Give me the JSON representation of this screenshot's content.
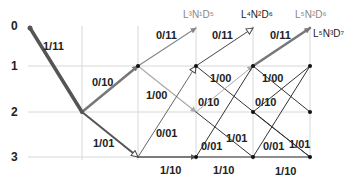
{
  "diagram": {
    "type": "trellis",
    "row_labels": [
      "0",
      "1",
      "2",
      "3"
    ],
    "grid": {
      "rows_y": [
        66,
        112,
        157
      ],
      "cols_x": [
        82,
        138,
        196,
        253,
        310
      ],
      "color": "#d8d8d8"
    },
    "state_labels": [
      {
        "text": "L³N¹D⁵",
        "x": 183,
        "y": 18,
        "color": "#888888"
      },
      {
        "text": "L⁴N²D⁶",
        "x": 241,
        "y": 18,
        "color": "#222222"
      },
      {
        "text": "L⁵N²D⁶",
        "x": 295,
        "y": 18,
        "color": "#888888"
      },
      {
        "text": "L⁵N³D⁷",
        "x": 313,
        "y": 37,
        "color": "#222222"
      }
    ],
    "edges": [
      {
        "from": [
          30,
          28
        ],
        "to": [
          82,
          112
        ],
        "label": "1/11",
        "lx": 43,
        "ly": 50,
        "color": "#555555",
        "width": 3.5,
        "arrow": "none"
      },
      {
        "from": [
          82,
          112
        ],
        "to": [
          138,
          66
        ],
        "label": "0/10",
        "lx": 92,
        "ly": 86,
        "color": "#777777",
        "width": 2.5,
        "arrow": "filled"
      },
      {
        "from": [
          82,
          112
        ],
        "to": [
          138,
          157
        ],
        "label": "1/01",
        "lx": 93,
        "ly": 147,
        "color": "#555555",
        "width": 2,
        "arrow": "hollow"
      },
      {
        "from": [
          138,
          66
        ],
        "to": [
          196,
          28
        ],
        "label": "0/11",
        "lx": 156,
        "ly": 39,
        "color": "#888888",
        "width": 1.2,
        "arrow": "filled"
      },
      {
        "from": [
          138,
          66
        ],
        "to": [
          196,
          112
        ],
        "label": "1/00",
        "lx": 146,
        "ly": 99,
        "color": "#aaaaaa",
        "width": 1.2,
        "arrow": "filled"
      },
      {
        "from": [
          138,
          157
        ],
        "to": [
          196,
          66
        ],
        "label": "0/01",
        "lx": 156,
        "ly": 137,
        "color": "#666666",
        "width": 1,
        "arrow": "hollow"
      },
      {
        "from": [
          138,
          157
        ],
        "to": [
          196,
          157
        ],
        "label": "1/10",
        "lx": 160,
        "ly": 174,
        "color": "#555555",
        "width": 1.5,
        "arrow": "filled"
      },
      {
        "from": [
          196,
          66
        ],
        "to": [
          253,
          28
        ],
        "label": "0/11",
        "lx": 212,
        "ly": 39,
        "color": "#444444",
        "width": 1,
        "arrow": "hollow"
      },
      {
        "from": [
          196,
          66
        ],
        "to": [
          310,
          157
        ],
        "label": "1/00",
        "lx": 210,
        "ly": 82,
        "color": "#333333",
        "width": 1,
        "arrow": "none"
      },
      {
        "from": [
          196,
          112
        ],
        "to": [
          253,
          66
        ],
        "label": "0/10",
        "lx": 198,
        "ly": 106,
        "color": "#aaaaaa",
        "width": 1,
        "arrow": "filled"
      },
      {
        "from": [
          196,
          112
        ],
        "to": [
          253,
          157
        ],
        "label": "1/01",
        "lx": 226,
        "ly": 142,
        "color": "#333333",
        "width": 1,
        "arrow": "none"
      },
      {
        "from": [
          196,
          157
        ],
        "to": [
          253,
          66
        ],
        "label": "0/01",
        "lx": 201,
        "ly": 150,
        "color": "#333333",
        "width": 1,
        "arrow": "none"
      },
      {
        "from": [
          196,
          157
        ],
        "to": [
          253,
          157
        ],
        "label": "1/10",
        "lx": 213,
        "ly": 174,
        "color": "#333333",
        "width": 1,
        "arrow": "none"
      },
      {
        "from": [
          253,
          66
        ],
        "to": [
          310,
          28
        ],
        "label": "0/11",
        "lx": 270,
        "ly": 39,
        "color": "#777777",
        "width": 2.5,
        "arrow": "filled"
      },
      {
        "from": [
          253,
          66
        ],
        "to": [
          310,
          112
        ],
        "label": "1/00",
        "lx": 262,
        "ly": 82,
        "color": "#333333",
        "width": 1,
        "arrow": "none"
      },
      {
        "from": [
          253,
          112
        ],
        "to": [
          310,
          66
        ],
        "label": "0/10",
        "lx": 255,
        "ly": 106,
        "color": "#333333",
        "width": 1,
        "arrow": "none"
      },
      {
        "from": [
          253,
          112
        ],
        "to": [
          310,
          157
        ],
        "label": "1/01",
        "lx": 289,
        "ly": 148,
        "color": "#333333",
        "width": 1,
        "arrow": "none"
      },
      {
        "from": [
          253,
          157
        ],
        "to": [
          310,
          66
        ],
        "label": "0/01",
        "lx": 263,
        "ly": 150,
        "color": "#333333",
        "width": 1,
        "arrow": "none"
      },
      {
        "from": [
          253,
          157
        ],
        "to": [
          310,
          157
        ],
        "label": "1/10",
        "lx": 275,
        "ly": 175,
        "color": "#333333",
        "width": 1,
        "arrow": "none"
      }
    ],
    "nodes": [
      [
        30,
        28
      ],
      [
        82,
        112
      ],
      [
        138,
        66
      ],
      [
        196,
        66
      ],
      [
        196,
        157
      ],
      [
        253,
        66
      ],
      [
        253,
        112
      ],
      [
        253,
        157
      ],
      [
        310,
        66
      ],
      [
        310,
        112
      ],
      [
        310,
        157
      ]
    ]
  }
}
